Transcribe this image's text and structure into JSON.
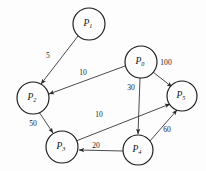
{
  "figure": {
    "title": "",
    "background_color": "#fdfdfd",
    "stroke_color": "#1a1a1a",
    "width": 206,
    "height": 171
  },
  "diagram": {
    "type": "directed-weighted-graph",
    "nodes": [
      {
        "id": "P0",
        "label": "P",
        "sub": "0",
        "cx": 141,
        "cy": 62,
        "r": 16
      },
      {
        "id": "P1",
        "label": "P",
        "sub": "1",
        "cx": 89,
        "cy": 24,
        "r": 16
      },
      {
        "id": "P2",
        "label": "P",
        "sub": "2",
        "cx": 33,
        "cy": 98,
        "r": 16
      },
      {
        "id": "P3",
        "label": "P",
        "sub": "3",
        "cx": 62,
        "cy": 147,
        "r": 16
      },
      {
        "id": "P4",
        "label": "P",
        "sub": "4",
        "cx": 138,
        "cy": 150,
        "r": 15
      },
      {
        "id": "P5",
        "label": "P",
        "sub": "5",
        "cx": 182,
        "cy": 96,
        "r": 15
      }
    ],
    "edges": [
      {
        "id": "e-p1-p2",
        "from": "P1",
        "to": "P2",
        "weight": "5",
        "x1": 78,
        "y1": 36,
        "x2": 41,
        "y2": 84,
        "lx": 48,
        "ly": 56
      },
      {
        "id": "e-p0-p2",
        "from": "P0",
        "to": "P2",
        "weight": "10",
        "x1": 125,
        "y1": 66,
        "x2": 49,
        "y2": 94,
        "lx": 83,
        "ly": 73
      },
      {
        "id": "e-p0-p5",
        "from": "P0",
        "to": "P5",
        "weight": "100",
        "x1": 153,
        "y1": 72,
        "x2": 172,
        "y2": 87,
        "lx": 166,
        "ly": 63
      },
      {
        "id": "e-p0-p4",
        "from": "P0",
        "to": "P4",
        "weight": "30",
        "x1": 140,
        "y1": 78,
        "x2": 138,
        "y2": 134,
        "lx": 131,
        "ly": 88
      },
      {
        "id": "e-p2-p3",
        "from": "P2",
        "to": "P3",
        "weight": "50",
        "x1": 39,
        "y1": 112,
        "x2": 53,
        "y2": 133,
        "lx": 33,
        "ly": 124
      },
      {
        "id": "e-p3-p5",
        "from": "P3",
        "to": "P5",
        "weight": "10",
        "x1": 76,
        "y1": 141,
        "x2": 170,
        "y2": 104,
        "lx": 99,
        "ly": 115
      },
      {
        "id": "e-p4-p3",
        "from": "P4",
        "to": "P3",
        "weight": "20",
        "x1": 123,
        "y1": 151,
        "x2": 79,
        "y2": 150,
        "lx": 96,
        "ly": 146
      },
      {
        "id": "e-p4-p5",
        "from": "P4",
        "to": "P5",
        "weight": "60",
        "x1": 150,
        "y1": 141,
        "x2": 177,
        "y2": 110,
        "lx": 167,
        "ly": 130
      }
    ]
  }
}
